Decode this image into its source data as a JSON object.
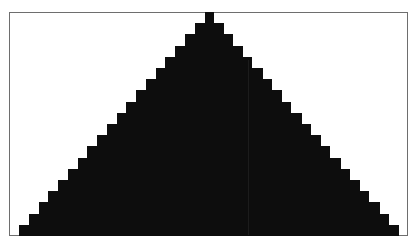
{
  "figure": {
    "frame": {
      "left": 9,
      "top": 12,
      "right": 408,
      "bottom": 236,
      "border_color": "#6e6e6e"
    },
    "fill_color": "#0d0d0d",
    "background_color": "#ffffff",
    "rows": 20,
    "center_x": 209,
    "top_y": 12,
    "row_height": 11.2,
    "top_half_width": 4.5,
    "bottom_half_width": 190
  }
}
